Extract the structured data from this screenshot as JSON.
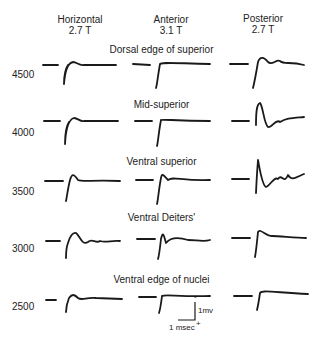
{
  "figure": {
    "columns": [
      {
        "name": "Horizontal",
        "field": "2.7 T"
      },
      {
        "name": "Anterior",
        "field": "3.1 T"
      },
      {
        "name": "Posterior",
        "field": "2.7 T"
      }
    ],
    "rows": [
      {
        "label": "Dorsal edge of superior",
        "depth": "4500"
      },
      {
        "label": "Mid-superior",
        "depth": "4000"
      },
      {
        "label": "Ventral superior",
        "depth": "3500"
      },
      {
        "label": "Ventral Deiters'",
        "depth": "3000"
      },
      {
        "label": "Ventral edge of nuclei",
        "depth": "2500"
      }
    ],
    "scale_bar": {
      "voltage": "1mv",
      "time": "1 msec",
      "minus": "-",
      "plus": "+"
    }
  }
}
